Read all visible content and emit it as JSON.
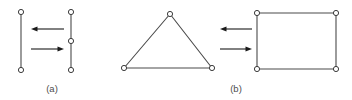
{
  "figure": {
    "background_color": "#ffffff",
    "stroke_color": "#4a4a4a",
    "node_fill_color": "#ffffff",
    "node_stroke_color": "#3c3c3c",
    "arrow_color": "#1a1a1a",
    "caption_color": "#4d4d4d",
    "panels": [
      {
        "id": "a",
        "label": "(a)",
        "label_x": 52,
        "label_y": 92,
        "left_shape": {
          "name": "vertical-segment-two-nodes",
          "edges": [
            {
              "x1": 21,
              "y1": 12,
              "x2": 21,
              "y2": 70
            }
          ],
          "nodes": [
            {
              "cx": 21,
              "cy": 12,
              "r": 2.6
            },
            {
              "cx": 21,
              "cy": 70,
              "r": 2.6
            }
          ]
        },
        "right_shape": {
          "name": "vertical-segment-three-nodes",
          "edges": [
            {
              "x1": 71,
              "y1": 12,
              "x2": 71,
              "y2": 41
            },
            {
              "x1": 71,
              "y1": 41,
              "x2": 71,
              "y2": 70
            }
          ],
          "nodes": [
            {
              "cx": 71,
              "cy": 12,
              "r": 2.6
            },
            {
              "cx": 71,
              "cy": 41,
              "r": 2.6
            },
            {
              "cx": 71,
              "cy": 70,
              "r": 2.6
            }
          ]
        },
        "arrows": [
          {
            "name": "arrow-left-top",
            "direction": "left",
            "x1": 64,
            "x2": 31,
            "y": 29
          },
          {
            "name": "arrow-right-bottom",
            "direction": "right",
            "x1": 31,
            "x2": 64,
            "y": 49
          }
        ]
      },
      {
        "id": "b",
        "label": "(b)",
        "label_x": 236,
        "label_y": 92,
        "left_shape": {
          "name": "triangle",
          "edges": [
            {
              "x1": 124,
              "y1": 68,
              "x2": 170,
              "y2": 14
            },
            {
              "x1": 170,
              "y1": 14,
              "x2": 212,
              "y2": 68
            },
            {
              "x1": 212,
              "y1": 68,
              "x2": 124,
              "y2": 68
            }
          ],
          "nodes": [
            {
              "cx": 170,
              "cy": 14,
              "r": 2.6
            },
            {
              "cx": 124,
              "cy": 68,
              "r": 2.6
            },
            {
              "cx": 212,
              "cy": 68,
              "r": 2.6
            }
          ]
        },
        "right_shape": {
          "name": "rectangle",
          "edges": [
            {
              "x1": 257,
              "y1": 13,
              "x2": 336,
              "y2": 13
            },
            {
              "x1": 336,
              "y1": 13,
              "x2": 336,
              "y2": 69
            },
            {
              "x1": 336,
              "y1": 69,
              "x2": 257,
              "y2": 69
            },
            {
              "x1": 257,
              "y1": 69,
              "x2": 257,
              "y2": 13
            }
          ],
          "nodes": [
            {
              "cx": 257,
              "cy": 13,
              "r": 2.6
            },
            {
              "cx": 336,
              "cy": 13,
              "r": 2.6
            },
            {
              "cx": 336,
              "cy": 69,
              "r": 2.6
            },
            {
              "cx": 257,
              "cy": 69,
              "r": 2.6
            }
          ]
        },
        "arrows": [
          {
            "name": "arrow-left-top",
            "direction": "left",
            "x1": 252,
            "x2": 220,
            "y": 29
          },
          {
            "name": "arrow-right-bottom",
            "direction": "right",
            "x1": 220,
            "x2": 252,
            "y": 49
          }
        ]
      }
    ]
  }
}
